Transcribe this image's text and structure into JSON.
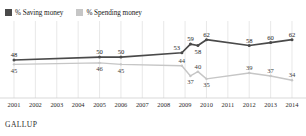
{
  "top_note": "",
  "brand": "GALLUP",
  "legend": {
    "items": [
      {
        "label": "% Saving money",
        "color": "#4a4a4a",
        "key": "saving"
      },
      {
        "label": "% Spending money",
        "color": "#c6c6c6",
        "key": "spending"
      }
    ]
  },
  "chart_data": {
    "type": "line",
    "title": "",
    "subtitle": "",
    "xlabel": "",
    "ylabel": "",
    "ylim": [
      28,
      68
    ],
    "xlim": [
      0,
      15
    ],
    "grid": "vertical",
    "legend_position": "top-left",
    "categories": [
      "2001",
      "2002",
      "2003",
      "2004",
      "2005",
      "2006",
      "2007",
      "2008",
      "2009",
      "2010",
      "2011",
      "2012",
      "2013",
      "2014"
    ],
    "x_tick_labels": [
      "2001",
      "2002",
      "2003",
      "2004",
      "2005",
      "2006",
      "2007",
      "2008",
      "2009",
      "2010",
      "2011",
      "2012",
      "2013",
      "2014"
    ],
    "series": [
      {
        "name": "% Saving money",
        "color": "#4a4a4a",
        "points": [
          {
            "x": 0.0,
            "value": 48,
            "label": "48",
            "label_pos": "above"
          },
          {
            "x": 4.0,
            "value": 50,
            "label": "50",
            "label_pos": "above"
          },
          {
            "x": 5.0,
            "value": 50,
            "label": "50",
            "label_pos": "above"
          },
          {
            "x": 7.85,
            "value": 53,
            "label": "53",
            "label_pos": "left"
          },
          {
            "x": 8.25,
            "value": 59,
            "label": "59",
            "label_pos": "above"
          },
          {
            "x": 8.6,
            "value": 58,
            "label": "58",
            "label_pos": "below"
          },
          {
            "x": 9.0,
            "value": 62,
            "label": "62",
            "label_pos": "above"
          },
          {
            "x": 11.0,
            "value": 58,
            "label": "58",
            "label_pos": "above"
          },
          {
            "x": 12.0,
            "value": 60,
            "label": "60",
            "label_pos": "above"
          },
          {
            "x": 13.0,
            "value": 62,
            "label": "62",
            "label_pos": "above"
          }
        ]
      },
      {
        "name": "% Spending money",
        "color": "#c6c6c6",
        "points": [
          {
            "x": 0.0,
            "value": 45,
            "label": "45",
            "label_pos": "below"
          },
          {
            "x": 4.0,
            "value": 46,
            "label": "46",
            "label_pos": "below"
          },
          {
            "x": 5.0,
            "value": 45,
            "label": "45",
            "label_pos": "below"
          },
          {
            "x": 7.85,
            "value": 44,
            "label": "44",
            "label_pos": "above"
          },
          {
            "x": 8.25,
            "value": 37,
            "label": "37",
            "label_pos": "below"
          },
          {
            "x": 8.6,
            "value": 40,
            "label": "40",
            "label_pos": "above"
          },
          {
            "x": 9.0,
            "value": 35,
            "label": "35",
            "label_pos": "below"
          },
          {
            "x": 11.0,
            "value": 39,
            "label": "39",
            "label_pos": "above"
          },
          {
            "x": 12.0,
            "value": 37,
            "label": "37",
            "label_pos": "above"
          },
          {
            "x": 13.0,
            "value": 34,
            "label": "34",
            "label_pos": "above"
          }
        ]
      }
    ]
  }
}
